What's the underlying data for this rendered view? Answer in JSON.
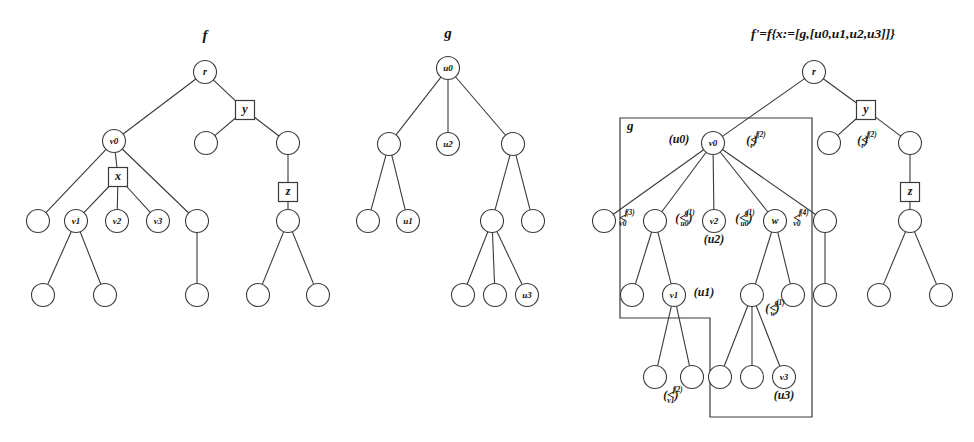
{
  "figure": {
    "caption_titles": {
      "tree_f": "f",
      "tree_g": "g",
      "tree_fprime": "f'=f{x:=[g,[u0,u1,u2,u3]]}"
    },
    "region_label_g": "g"
  },
  "tree_f": {
    "title": "f",
    "nodes": [
      {
        "id": "r",
        "label": "r",
        "shape": "circle",
        "x": 205,
        "y": 72
      },
      {
        "id": "y",
        "label": "y",
        "shape": "box",
        "x": 245,
        "y": 110
      },
      {
        "id": "fy1",
        "label": "",
        "shape": "circle",
        "x": 206,
        "y": 143
      },
      {
        "id": "fy2",
        "label": "",
        "shape": "circle",
        "x": 288,
        "y": 143
      },
      {
        "id": "z",
        "label": "z",
        "shape": "box",
        "x": 288,
        "y": 192
      },
      {
        "id": "fz1",
        "label": "",
        "shape": "circle",
        "x": 288,
        "y": 221
      },
      {
        "id": "fz2",
        "label": "",
        "shape": "circle",
        "x": 258,
        "y": 295
      },
      {
        "id": "fz3",
        "label": "",
        "shape": "circle",
        "x": 318,
        "y": 295
      },
      {
        "id": "v0",
        "label": "v0",
        "shape": "circle",
        "x": 114,
        "y": 141
      },
      {
        "id": "x",
        "label": "x",
        "shape": "box",
        "x": 118,
        "y": 177
      },
      {
        "id": "fa",
        "label": "",
        "shape": "circle",
        "x": 38,
        "y": 221
      },
      {
        "id": "v1",
        "label": "v1",
        "shape": "circle",
        "x": 76,
        "y": 221
      },
      {
        "id": "v2",
        "label": "v2",
        "shape": "circle",
        "x": 117,
        "y": 221
      },
      {
        "id": "v3",
        "label": "v3",
        "shape": "circle",
        "x": 158,
        "y": 221
      },
      {
        "id": "fb",
        "label": "",
        "shape": "circle",
        "x": 197,
        "y": 221
      },
      {
        "id": "fc",
        "label": "",
        "shape": "circle",
        "x": 43,
        "y": 295
      },
      {
        "id": "fd",
        "label": "",
        "shape": "circle",
        "x": 105,
        "y": 295
      },
      {
        "id": "fe",
        "label": "",
        "shape": "circle",
        "x": 197,
        "y": 295
      }
    ],
    "edges": [
      [
        "r",
        "y"
      ],
      [
        "r",
        "v0"
      ],
      [
        "y",
        "fy1"
      ],
      [
        "y",
        "fy2"
      ],
      [
        "fy2",
        "z"
      ],
      [
        "z",
        "fz1"
      ],
      [
        "fz1",
        "fz2"
      ],
      [
        "fz1",
        "fz3"
      ],
      [
        "v0",
        "x"
      ],
      [
        "v0",
        "fa"
      ],
      [
        "v0",
        "fb"
      ],
      [
        "x",
        "v1"
      ],
      [
        "x",
        "v2"
      ],
      [
        "x",
        "v3"
      ],
      [
        "v1",
        "fc"
      ],
      [
        "v1",
        "fd"
      ],
      [
        "fb",
        "fe"
      ]
    ]
  },
  "tree_g": {
    "title": "g",
    "nodes": [
      {
        "id": "u0",
        "label": "u0",
        "shape": "circle",
        "x": 448,
        "y": 68
      },
      {
        "id": "ga",
        "label": "",
        "shape": "circle",
        "x": 389,
        "y": 144
      },
      {
        "id": "u2",
        "label": "u2",
        "shape": "circle",
        "x": 448,
        "y": 144
      },
      {
        "id": "gb",
        "label": "",
        "shape": "circle",
        "x": 513,
        "y": 144
      },
      {
        "id": "gc",
        "label": "",
        "shape": "circle",
        "x": 368,
        "y": 221
      },
      {
        "id": "u1",
        "label": "u1",
        "shape": "circle",
        "x": 408,
        "y": 221
      },
      {
        "id": "gd",
        "label": "",
        "shape": "circle",
        "x": 492,
        "y": 221
      },
      {
        "id": "ge",
        "label": "",
        "shape": "circle",
        "x": 533,
        "y": 221
      },
      {
        "id": "gf",
        "label": "",
        "shape": "circle",
        "x": 463,
        "y": 295
      },
      {
        "id": "gg",
        "label": "",
        "shape": "circle",
        "x": 495,
        "y": 295
      },
      {
        "id": "u3",
        "label": "u3",
        "shape": "circle",
        "x": 527,
        "y": 295
      }
    ],
    "edges": [
      [
        "u0",
        "ga"
      ],
      [
        "u0",
        "u2"
      ],
      [
        "u0",
        "gb"
      ],
      [
        "ga",
        "gc"
      ],
      [
        "ga",
        "u1"
      ],
      [
        "gb",
        "gd"
      ],
      [
        "gb",
        "ge"
      ],
      [
        "gd",
        "gf"
      ],
      [
        "gd",
        "gg"
      ],
      [
        "gd",
        "u3"
      ]
    ]
  },
  "tree_fprime": {
    "title": "f'=f{x:=[g,[u0,u1,u2,u3]]}",
    "nodes": [
      {
        "id": "r",
        "label": "r",
        "shape": "circle",
        "x": 814,
        "y": 72
      },
      {
        "id": "y",
        "label": "y",
        "shape": "box",
        "x": 866,
        "y": 110
      },
      {
        "id": "py1",
        "label": "",
        "shape": "circle",
        "x": 829,
        "y": 143
      },
      {
        "id": "py2",
        "label": "",
        "shape": "circle",
        "x": 910,
        "y": 143
      },
      {
        "id": "z",
        "label": "z",
        "shape": "box",
        "x": 910,
        "y": 192
      },
      {
        "id": "pz1",
        "label": "",
        "shape": "circle",
        "x": 910,
        "y": 221
      },
      {
        "id": "pz2",
        "label": "",
        "shape": "circle",
        "x": 879,
        "y": 295
      },
      {
        "id": "pz3",
        "label": "",
        "shape": "circle",
        "x": 941,
        "y": 295
      },
      {
        "id": "v0",
        "label": "v0",
        "shape": "circle",
        "x": 713,
        "y": 143
      },
      {
        "id": "pa",
        "label": "",
        "shape": "circle",
        "x": 604,
        "y": 221
      },
      {
        "id": "pb",
        "label": "",
        "shape": "circle",
        "x": 655,
        "y": 221
      },
      {
        "id": "v2",
        "label": "v2",
        "shape": "circle",
        "x": 714,
        "y": 221
      },
      {
        "id": "w",
        "label": "w",
        "shape": "circle",
        "x": 775,
        "y": 221
      },
      {
        "id": "pc",
        "label": "",
        "shape": "circle",
        "x": 825,
        "y": 221
      },
      {
        "id": "pd",
        "label": "",
        "shape": "circle",
        "x": 632,
        "y": 295
      },
      {
        "id": "v1",
        "label": "v1",
        "shape": "circle",
        "x": 674,
        "y": 295
      },
      {
        "id": "pe",
        "label": "",
        "shape": "circle",
        "x": 752,
        "y": 295
      },
      {
        "id": "pf",
        "label": "",
        "shape": "circle",
        "x": 793,
        "y": 295
      },
      {
        "id": "pg",
        "label": "",
        "shape": "circle",
        "x": 825,
        "y": 295
      },
      {
        "id": "ph",
        "label": "",
        "shape": "circle",
        "x": 655,
        "y": 377
      },
      {
        "id": "pi",
        "label": "",
        "shape": "circle",
        "x": 692,
        "y": 377
      },
      {
        "id": "pj",
        "label": "",
        "shape": "circle",
        "x": 720,
        "y": 377
      },
      {
        "id": "pk",
        "label": "",
        "shape": "circle",
        "x": 752,
        "y": 377
      },
      {
        "id": "v3",
        "label": "v3",
        "shape": "circle",
        "x": 784,
        "y": 377
      }
    ],
    "edges": [
      [
        "r",
        "y"
      ],
      [
        "r",
        "v0"
      ],
      [
        "y",
        "py1"
      ],
      [
        "y",
        "py2"
      ],
      [
        "py2",
        "z"
      ],
      [
        "z",
        "pz1"
      ],
      [
        "pz1",
        "pz2"
      ],
      [
        "pz1",
        "pz3"
      ],
      [
        "v0",
        "pa"
      ],
      [
        "v0",
        "pb"
      ],
      [
        "v0",
        "v2"
      ],
      [
        "v0",
        "w"
      ],
      [
        "v0",
        "pc"
      ],
      [
        "pb",
        "pd"
      ],
      [
        "pb",
        "v1"
      ],
      [
        "v1",
        "ph"
      ],
      [
        "v1",
        "pi"
      ],
      [
        "w",
        "pe"
      ],
      [
        "w",
        "pf"
      ],
      [
        "pe",
        "pj"
      ],
      [
        "pe",
        "pk"
      ],
      [
        "pe",
        "v3"
      ],
      [
        "pc",
        "pg"
      ]
    ],
    "annotations": [
      {
        "id": "ann-u0",
        "text": "(u0)",
        "x": 679,
        "y": 143,
        "anchor": "middle"
      },
      {
        "id": "ann-ltr",
        "base": "(<",
        "sup": "(2)",
        "num": "f",
        "den": "r",
        "close": ")",
        "x": 756,
        "y": 144
      },
      {
        "id": "ann-rtr",
        "base": "(<",
        "sup": "(2)",
        "num": "f",
        "den": "r",
        "close": ")",
        "x": 867,
        "y": 144
      },
      {
        "id": "ann-lv0",
        "base": "<",
        "sup": "(3)",
        "num": "f",
        "den": "v0",
        "close": "",
        "x": 627,
        "y": 222
      },
      {
        "id": "ann-u0g1",
        "base": "(<",
        "sup": "(1)",
        "num": "g",
        "den": "u0",
        "close": ")",
        "x": 685,
        "y": 222
      },
      {
        "id": "ann-u0g2",
        "base": "(<",
        "sup": "(1)",
        "num": "g",
        "den": "u0",
        "close": ")",
        "x": 745,
        "y": 222
      },
      {
        "id": "ann-rv0",
        "base": "<",
        "sup": "(4)",
        "num": "f",
        "den": "v0",
        "close": "",
        "x": 801,
        "y": 222
      },
      {
        "id": "ann-u2",
        "text": "(u2)",
        "x": 714,
        "y": 243,
        "anchor": "middle"
      },
      {
        "id": "ann-u1",
        "text": "(u1)",
        "x": 704,
        "y": 296,
        "anchor": "middle"
      },
      {
        "id": "ann-wg",
        "base": "(<",
        "sup": "(1)",
        "num": "g",
        "den": "w",
        "close": ")",
        "x": 775,
        "y": 312
      },
      {
        "id": "ann-v1f",
        "base": "(<",
        "sup": "(2)",
        "num": "f",
        "den": "v1",
        "close": ")",
        "x": 673,
        "y": 399
      },
      {
        "id": "ann-u3",
        "text": "(u3)",
        "x": 784,
        "y": 399,
        "anchor": "middle"
      }
    ],
    "region": {
      "label": "g",
      "label_x": 627,
      "label_y": 130,
      "points": "620,118 812,118 812,417 710,417 710,318 620,318"
    }
  }
}
